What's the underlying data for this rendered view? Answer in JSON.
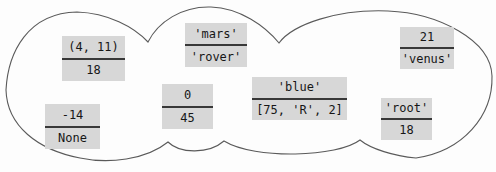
{
  "diagram": {
    "type": "dictionary-cloud",
    "colors": {
      "box_fill": "#d7d7d7",
      "divider": "#383838",
      "outline": "#5a5a5a",
      "text": "#161616",
      "background": "#fdfdfd"
    },
    "entries": [
      {
        "key": "(4, 11)",
        "value": "18"
      },
      {
        "key": "'mars'",
        "value": "'rover'"
      },
      {
        "key": "21",
        "value": "'venus'"
      },
      {
        "key": "-14",
        "value": "None"
      },
      {
        "key": "0",
        "value": "45"
      },
      {
        "key": "'blue'",
        "value": "[75, 'R', 2]"
      },
      {
        "key": "'root'",
        "value": "18"
      }
    ]
  }
}
